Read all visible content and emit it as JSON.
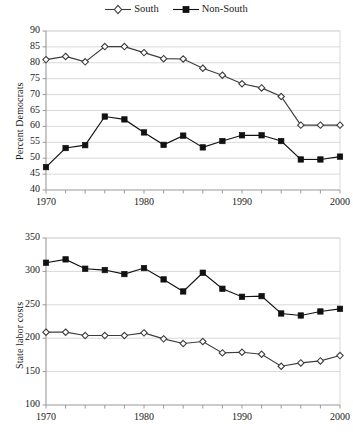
{
  "legend": {
    "entries": [
      {
        "label": "South",
        "marker": "hollow-diamond-icon",
        "color": "#3d3d3d"
      },
      {
        "label": "Non-South",
        "marker": "filled-square-icon",
        "color": "#111111"
      }
    ]
  },
  "chart_data": [
    {
      "type": "line",
      "id": "percent-democrats",
      "title": "",
      "xlabel": "",
      "ylabel": "Percent Democrats",
      "xlim": [
        1970,
        2000
      ],
      "ylim": [
        40,
        90
      ],
      "yticks": [
        40,
        45,
        50,
        55,
        60,
        65,
        70,
        75,
        80,
        85,
        90
      ],
      "xticks": [
        1970,
        1980,
        1990,
        2000
      ],
      "xminorstep": 2,
      "grid": "horizontal",
      "legend_position": "top-center",
      "x": [
        1970,
        1972,
        1974,
        1976,
        1978,
        1980,
        1982,
        1984,
        1986,
        1988,
        1990,
        1992,
        1994,
        1996,
        1998,
        2000
      ],
      "series": [
        {
          "name": "South",
          "marker": "hollow-diamond",
          "color": "#3d3d3d",
          "values": [
            81.0,
            82.0,
            80.3,
            85.1,
            85.1,
            83.2,
            81.3,
            81.2,
            78.3,
            76.1,
            73.4,
            72.1,
            69.4,
            60.4,
            60.4,
            60.4
          ]
        },
        {
          "name": "Non-South",
          "marker": "filled-square",
          "color": "#111111",
          "values": [
            47.2,
            53.2,
            54.1,
            63.1,
            62.2,
            58.1,
            54.2,
            57.1,
            53.4,
            55.4,
            57.2,
            57.2,
            55.4,
            49.6,
            49.6,
            50.5
          ]
        }
      ]
    },
    {
      "type": "line",
      "id": "state-labor-costs",
      "title": "",
      "xlabel": "",
      "ylabel": "State labor costs",
      "xlim": [
        1970,
        2000
      ],
      "ylim": [
        100,
        350
      ],
      "yticks": [
        100,
        150,
        200,
        250,
        300,
        350
      ],
      "xticks": [
        1970,
        1980,
        1990,
        2000
      ],
      "xminorstep": 2,
      "grid": "horizontal",
      "legend_position": "none",
      "x": [
        1970,
        1972,
        1974,
        1976,
        1978,
        1980,
        1982,
        1984,
        1986,
        1988,
        1990,
        1992,
        1994,
        1996,
        1998,
        2000
      ],
      "series": [
        {
          "name": "Non-South",
          "marker": "filled-square",
          "color": "#111111",
          "values": [
            313,
            318,
            304,
            302,
            296,
            305,
            288,
            270,
            298,
            274,
            262,
            263,
            237,
            234,
            240,
            244
          ]
        },
        {
          "name": "South",
          "marker": "hollow-diamond",
          "color": "#3d3d3d",
          "values": [
            209,
            209,
            204,
            204,
            204,
            208,
            199,
            192,
            195,
            178,
            179,
            176,
            158,
            163,
            166,
            174
          ]
        }
      ]
    }
  ],
  "style": {
    "grid_color": "#d9d9d9",
    "axis_color": "#9a9a9a",
    "line_color_south": "#3d3d3d",
    "line_color_nonsouth": "#111111",
    "background": "#ffffff"
  }
}
